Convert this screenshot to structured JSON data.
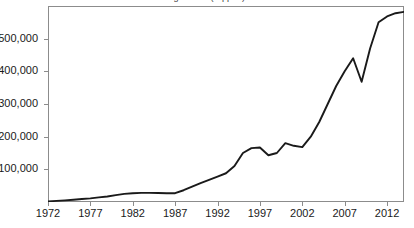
{
  "chart": {
    "title_sliver": "figure title (clipped)",
    "frame_color": "#8c8c8c",
    "line_color": "#1a1a1a",
    "background": "#ffffff"
  },
  "chart_data": {
    "type": "line",
    "title": "",
    "xlabel": "",
    "ylabel": "",
    "grid": false,
    "legend": null,
    "xlim": [
      1972,
      2014
    ],
    "ylim": [
      0,
      600000
    ],
    "xtick_labels": [
      "1972",
      "1977",
      "1982",
      "1987",
      "1992",
      "1997",
      "2002",
      "2007",
      "2012"
    ],
    "xticks": [
      1972,
      1977,
      1982,
      1987,
      1992,
      1997,
      2002,
      2007,
      2012
    ],
    "ytick_labels": [
      "100,000",
      "200,000",
      "300,000",
      "400,000",
      "500,000"
    ],
    "yticks": [
      100000,
      200000,
      300000,
      400000,
      500000
    ],
    "series": [
      {
        "name": "value",
        "x": [
          1972,
          1973,
          1974,
          1975,
          1976,
          1977,
          1978,
          1979,
          1980,
          1981,
          1982,
          1983,
          1984,
          1985,
          1986,
          1987,
          1988,
          1989,
          1990,
          1991,
          1992,
          1993,
          1994,
          1995,
          1996,
          1997,
          1998,
          1999,
          2000,
          2001,
          2002,
          2003,
          2004,
          2005,
          2006,
          2007,
          2008,
          2009,
          2010,
          2011,
          2012,
          2013,
          2014
        ],
        "values": [
          2000,
          3500,
          5000,
          7000,
          9000,
          11000,
          14000,
          17000,
          21000,
          25000,
          27000,
          28000,
          28000,
          27500,
          27000,
          27000,
          36000,
          47000,
          58000,
          68000,
          78000,
          88000,
          110000,
          150000,
          165000,
          167000,
          143000,
          150000,
          180000,
          172000,
          168000,
          200000,
          245000,
          300000,
          355000,
          400000,
          440000,
          368000,
          470000,
          550000,
          568000,
          578000,
          582000
        ]
      }
    ]
  }
}
